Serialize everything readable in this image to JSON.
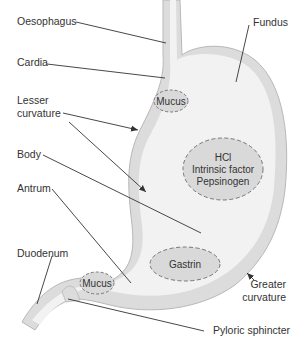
{
  "diagram": {
    "colors": {
      "wall": "#dcdcdc",
      "wall_edge": "#b8b8b8",
      "lumen": "#f2f2f2",
      "secretion_fill": "#d9d9d9",
      "secretion_border": "#777777",
      "leader_line": "#333333",
      "text": "#333333"
    },
    "labels": {
      "oesophagus": "Oesophagus",
      "fundus": "Fundus",
      "cardia": "Cardia",
      "lesser_curvature_line1": "Lesser",
      "lesser_curvature_line2": "curvature",
      "body": "Body",
      "antrum": "Antrum",
      "duodenum": "Duodenum",
      "greater_curvature_line1": "Greater",
      "greater_curvature_line2": "curvature",
      "pyloric_sphincter": "Pyloric sphincter"
    },
    "secretions": {
      "mucus_top": "Mucus",
      "glands_line1": "HCl",
      "glands_line2": "Intrinsic factor",
      "glands_line3": "Pepsinogen",
      "gastrin": "Gastrin",
      "mucus_bottom": "Mucus"
    }
  }
}
